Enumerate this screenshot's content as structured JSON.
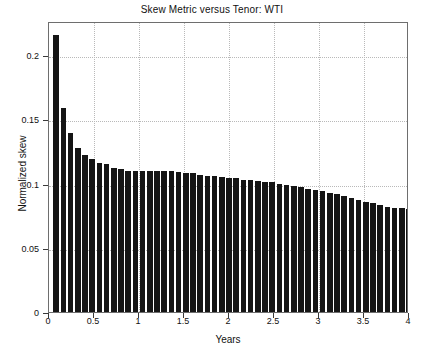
{
  "chart_data": {
    "type": "bar",
    "title": "Skew Metric versus Tenor: WTI",
    "xlabel": "Years",
    "ylabel": "Normalized skew",
    "xlim": [
      0,
      4
    ],
    "ylim": [
      0,
      0.2265
    ],
    "grid": true,
    "legend": null,
    "bar_color": "#151515",
    "xticks": [
      0,
      0.5,
      1,
      1.5,
      2,
      2.5,
      3,
      3.5,
      4
    ],
    "xticklabels": [
      "0",
      "0.5",
      "1",
      "1.5",
      "2",
      "2.5",
      "3",
      "3.5",
      "4"
    ],
    "yticks": [
      0,
      0.05,
      0.1,
      0.15,
      0.2
    ],
    "yticklabels": [
      "0",
      "0.05",
      "0.1",
      "0.15",
      "0.2"
    ],
    "x": [
      0.08,
      0.16,
      0.24,
      0.32,
      0.4,
      0.48,
      0.56,
      0.64,
      0.72,
      0.8,
      0.88,
      0.96,
      1.04,
      1.12,
      1.2,
      1.28,
      1.36,
      1.44,
      1.52,
      1.6,
      1.68,
      1.76,
      1.84,
      1.92,
      2.0,
      2.08,
      2.16,
      2.24,
      2.32,
      2.4,
      2.48,
      2.56,
      2.64,
      2.72,
      2.8,
      2.88,
      2.96,
      3.04,
      3.12,
      3.2,
      3.28,
      3.36,
      3.44,
      3.52,
      3.6,
      3.68,
      3.76,
      3.84,
      3.92,
      4.0
    ],
    "values": [
      0.216,
      0.159,
      0.139,
      0.128,
      0.122,
      0.119,
      0.116,
      0.115,
      0.112,
      0.111,
      0.11,
      0.11,
      0.11,
      0.11,
      0.11,
      0.11,
      0.11,
      0.109,
      0.108,
      0.108,
      0.107,
      0.106,
      0.106,
      0.105,
      0.104,
      0.104,
      0.103,
      0.103,
      0.102,
      0.101,
      0.101,
      0.1,
      0.099,
      0.098,
      0.097,
      0.096,
      0.095,
      0.094,
      0.093,
      0.092,
      0.09,
      0.089,
      0.087,
      0.086,
      0.085,
      0.083,
      0.082,
      0.081,
      0.081,
      0.08
    ]
  }
}
